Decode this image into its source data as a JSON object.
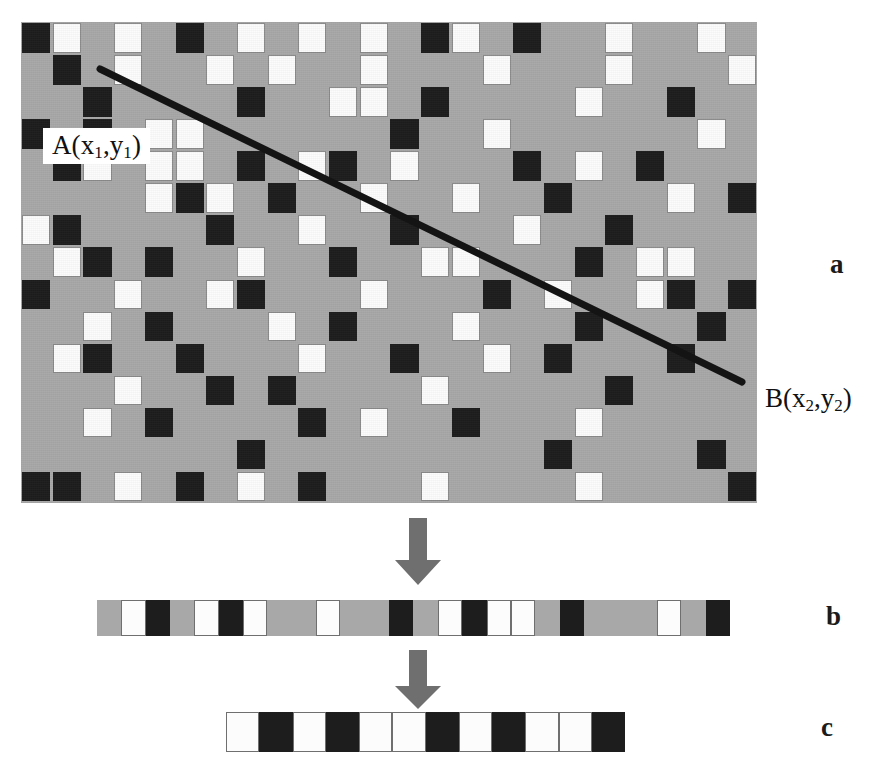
{
  "figure": {
    "caption_labels": {
      "panel_a": "a",
      "panel_b": "b",
      "panel_c": "c"
    },
    "annotations": {
      "point_a_prefix": "A(x",
      "point_a_sub1": "1",
      "point_a_mid": ",y",
      "point_a_sub2": "1",
      "point_a_suffix": ")",
      "point_b_prefix": "B(x",
      "point_b_sub1": "2",
      "point_b_mid": ",y",
      "point_b_sub2": "2",
      "point_b_suffix": ")",
      "point_a_text": "A(x1,y1)",
      "point_b_text": "B(x2,y2)"
    },
    "colors": {
      "background": "#a8a8a8",
      "cell_white": "#fcfcfc",
      "cell_black": "#1d1d1d",
      "cell_gray": "#a8a8a8",
      "line": "#141414",
      "arrow": "#6f6f6f",
      "text": "#111111"
    },
    "icons": {
      "arrow_1": "down-arrow-icon",
      "arrow_2": "down-arrow-icon"
    }
  },
  "chart_data": {
    "type": "heatmap",
    "title": "",
    "xlabel": "",
    "ylabel": "",
    "legend": [
      "black = 0",
      "gray = background",
      "white = 255"
    ],
    "panel_a": {
      "type": "heatmap",
      "rows": 15,
      "cols": 24,
      "cell_px": 30.7,
      "value_map": {
        "g": "gray",
        "w": "white",
        "k": "black"
      },
      "matrix": [
        [
          "k",
          "w",
          "g",
          "w",
          "g",
          "k",
          "g",
          "w",
          "g",
          "w",
          "g",
          "w",
          "g",
          "k",
          "w",
          "g",
          "k",
          "g",
          "g",
          "w",
          "g",
          "g",
          "w",
          "g"
        ],
        [
          "g",
          "k",
          "g",
          "w",
          "g",
          "g",
          "w",
          "g",
          "w",
          "g",
          "g",
          "w",
          "g",
          "g",
          "g",
          "w",
          "g",
          "g",
          "g",
          "w",
          "g",
          "g",
          "g",
          "w"
        ],
        [
          "g",
          "g",
          "k",
          "g",
          "g",
          "g",
          "g",
          "k",
          "g",
          "g",
          "w",
          "w",
          "g",
          "k",
          "g",
          "g",
          "g",
          "g",
          "w",
          "g",
          "g",
          "k",
          "g",
          "g"
        ],
        [
          "k",
          "g",
          "k",
          "g",
          "w",
          "w",
          "g",
          "g",
          "g",
          "g",
          "g",
          "g",
          "k",
          "g",
          "g",
          "w",
          "g",
          "g",
          "g",
          "g",
          "g",
          "g",
          "w",
          "g"
        ],
        [
          "g",
          "k",
          "w",
          "g",
          "w",
          "w",
          "g",
          "k",
          "g",
          "w",
          "k",
          "g",
          "w",
          "g",
          "g",
          "g",
          "k",
          "g",
          "w",
          "g",
          "k",
          "g",
          "g",
          "g"
        ],
        [
          "g",
          "g",
          "g",
          "g",
          "w",
          "k",
          "w",
          "g",
          "k",
          "g",
          "g",
          "w",
          "g",
          "g",
          "w",
          "g",
          "g",
          "k",
          "g",
          "g",
          "g",
          "w",
          "g",
          "k"
        ],
        [
          "w",
          "k",
          "g",
          "g",
          "g",
          "g",
          "k",
          "g",
          "g",
          "w",
          "g",
          "g",
          "k",
          "g",
          "g",
          "g",
          "w",
          "g",
          "g",
          "k",
          "g",
          "g",
          "g",
          "g"
        ],
        [
          "g",
          "w",
          "k",
          "g",
          "k",
          "g",
          "g",
          "w",
          "g",
          "g",
          "k",
          "g",
          "g",
          "w",
          "w",
          "g",
          "g",
          "g",
          "k",
          "g",
          "w",
          "w",
          "g",
          "g"
        ],
        [
          "k",
          "g",
          "g",
          "w",
          "g",
          "g",
          "w",
          "k",
          "g",
          "g",
          "g",
          "w",
          "g",
          "g",
          "g",
          "k",
          "g",
          "w",
          "g",
          "g",
          "w",
          "k",
          "g",
          "k"
        ],
        [
          "g",
          "g",
          "w",
          "g",
          "k",
          "g",
          "g",
          "g",
          "w",
          "g",
          "k",
          "g",
          "g",
          "g",
          "w",
          "g",
          "g",
          "g",
          "k",
          "g",
          "g",
          "g",
          "k",
          "g"
        ],
        [
          "g",
          "w",
          "k",
          "g",
          "g",
          "k",
          "g",
          "g",
          "g",
          "w",
          "g",
          "g",
          "k",
          "g",
          "g",
          "w",
          "g",
          "k",
          "g",
          "g",
          "g",
          "k",
          "g",
          "g"
        ],
        [
          "g",
          "g",
          "g",
          "w",
          "g",
          "g",
          "k",
          "g",
          "k",
          "g",
          "g",
          "g",
          "g",
          "w",
          "g",
          "g",
          "g",
          "g",
          "g",
          "k",
          "g",
          "g",
          "g",
          "g"
        ],
        [
          "g",
          "g",
          "w",
          "g",
          "k",
          "g",
          "g",
          "g",
          "g",
          "k",
          "g",
          "w",
          "g",
          "g",
          "k",
          "g",
          "g",
          "g",
          "w",
          "g",
          "g",
          "g",
          "g",
          "g"
        ],
        [
          "g",
          "g",
          "g",
          "g",
          "g",
          "g",
          "g",
          "k",
          "g",
          "g",
          "g",
          "g",
          "g",
          "g",
          "g",
          "g",
          "g",
          "k",
          "g",
          "g",
          "g",
          "g",
          "k",
          "g"
        ],
        [
          "k",
          "k",
          "g",
          "w",
          "g",
          "k",
          "g",
          "w",
          "g",
          "k",
          "g",
          "g",
          "g",
          "w",
          "g",
          "g",
          "g",
          "g",
          "w",
          "g",
          "g",
          "g",
          "g",
          "k"
        ]
      ],
      "line": {
        "x1_px": 79,
        "y1_px": 47,
        "x2_px": 721,
        "y2_px": 360,
        "label_start": "A(x1,y1)",
        "label_end": "B(x2,y2)"
      }
    },
    "panel_b": {
      "type": "heatmap",
      "rows": 1,
      "cols": 26,
      "cell_px": 24.35,
      "values": [
        "g",
        "w",
        "k",
        "g",
        "w",
        "k",
        "w",
        "g",
        "g",
        "w",
        "g",
        "g",
        "k",
        "g",
        "w",
        "k",
        "w",
        "w",
        "g",
        "k",
        "g",
        "g",
        "g",
        "w",
        "g",
        "k"
      ]
    },
    "panel_c": {
      "type": "heatmap",
      "rows": 1,
      "cols": 12,
      "cell_px": 33.25,
      "values": [
        "w",
        "k",
        "w",
        "k",
        "w",
        "w",
        "k",
        "w",
        "k",
        "w",
        "w",
        "k"
      ]
    }
  }
}
